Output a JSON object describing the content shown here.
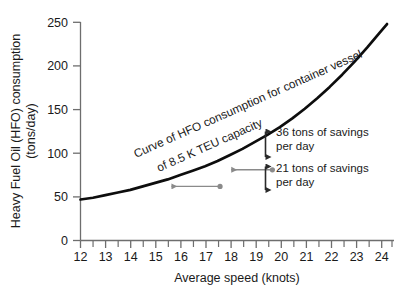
{
  "chart_data": {
    "type": "line",
    "title": "",
    "xlabel": "Average speed (knots)",
    "ylabel": "Heavy Fuel Oil (HFO) consumption (tons/day)",
    "ylabel_line1": "Heavy Fuel Oil (HFO) consumption",
    "ylabel_line2": "(tons/day)",
    "xlim": [
      12,
      24.5
    ],
    "ylim": [
      0,
      250
    ],
    "x_ticks": [
      12,
      13,
      14,
      15,
      16,
      17,
      18,
      19,
      20,
      21,
      22,
      23,
      24
    ],
    "x_tick_labels": [
      "12",
      "13",
      "14",
      "15",
      "16",
      "17",
      "18",
      "19",
      "20",
      "21",
      "22",
      "23",
      "24"
    ],
    "x_minor_ticks": [
      12.5,
      13.5,
      14.5,
      15.5,
      16.5,
      17.5,
      18.5,
      19.5,
      20.5,
      21.5,
      22.5,
      23.5
    ],
    "y_ticks": [
      0,
      50,
      100,
      150,
      200,
      250
    ],
    "y_tick_labels": [
      "0",
      "50",
      "100",
      "150",
      "200",
      "250"
    ],
    "grid": false,
    "legend": "none",
    "series": [
      {
        "name": "HFO consumption curve",
        "color": "#000000",
        "x": [
          12.0,
          12.5,
          13.0,
          13.5,
          14.0,
          14.5,
          15.0,
          15.5,
          16.0,
          16.5,
          17.0,
          17.5,
          18.0,
          18.5,
          19.0,
          19.5,
          20.0,
          20.5,
          21.0,
          21.5,
          22.0,
          22.5,
          23.0,
          23.5,
          24.0,
          24.3
        ],
        "y": [
          47,
          49,
          52,
          55,
          58,
          62,
          66,
          70,
          75,
          80,
          85,
          91,
          98,
          105,
          113,
          121,
          130,
          140,
          151,
          163,
          176,
          190,
          205,
          221,
          238,
          248
        ]
      }
    ],
    "annotations": [
      {
        "name": "curve-label",
        "text_line1": "Curve of HFO consumption for container vessel",
        "text_line2": "of 8.5 K TEU capacity",
        "rotation_deg": -24
      },
      {
        "name": "savings-upper",
        "text_line1": "36 tons of savings",
        "text_line2": "per day",
        "value": 36,
        "unit": "tons/day"
      },
      {
        "name": "savings-lower",
        "text_line1": "21 tons of savings",
        "text_line2": "per day",
        "value": 21,
        "unit": "tons/day"
      }
    ],
    "markers": [
      {
        "name": "upper-speed-marker",
        "x": 19.7,
        "y": 81,
        "color": "#8a8a8a"
      },
      {
        "name": "lower-speed-marker",
        "x": 17.6,
        "y": 62,
        "color": "#8a8a8a"
      }
    ],
    "colors": {
      "curve": "#0d0d0d",
      "axis": "#6e6e6e",
      "text": "#1a1a1a",
      "gray_arrow": "#8a8a8a",
      "black_arrow": "#2a2a2a"
    }
  }
}
